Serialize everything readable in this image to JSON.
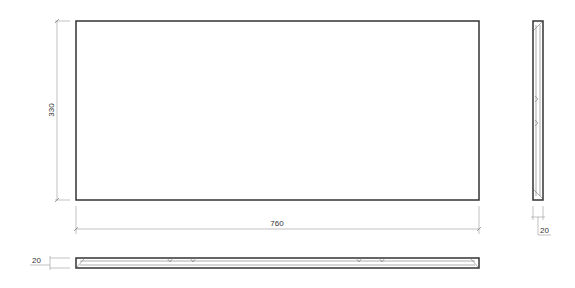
{
  "drawing": {
    "front_view": {
      "width_label": "760",
      "height_label": "330"
    },
    "side_view": {
      "thickness_label": "20"
    },
    "bottom_view": {
      "thickness_label": "20"
    }
  },
  "colors": {
    "outline": "#333333",
    "dimension": "#888888",
    "background": "#ffffff"
  }
}
